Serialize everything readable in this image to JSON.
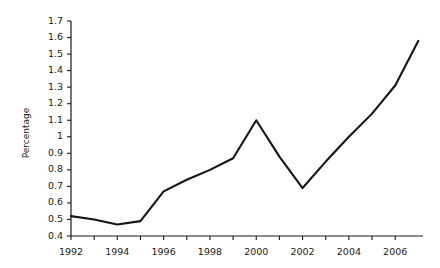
{
  "chart_data": {
    "type": "line",
    "title": "",
    "xlabel": "",
    "ylabel": "Percentage",
    "xlim": [
      1992,
      2007.2
    ],
    "ylim": [
      0.4,
      1.7
    ],
    "grid": false,
    "legend": false,
    "x": [
      1992,
      1993,
      1994,
      1995,
      1996,
      1997,
      1998,
      1999,
      2000,
      2001,
      2002,
      2003,
      2004,
      2005,
      2006,
      2007
    ],
    "values": [
      0.52,
      0.5,
      0.47,
      0.49,
      0.67,
      0.74,
      0.8,
      0.87,
      1.1,
      0.88,
      0.69,
      0.85,
      1.0,
      1.14,
      1.31,
      1.58
    ],
    "series": [
      {
        "name": "Percentage",
        "values": [
          0.52,
          0.5,
          0.47,
          0.49,
          0.67,
          0.74,
          0.8,
          0.87,
          1.1,
          0.88,
          0.69,
          0.85,
          1.0,
          1.14,
          1.31,
          1.58
        ]
      }
    ],
    "y_ticks": [
      0.4,
      0.5,
      0.6,
      0.7,
      0.8,
      0.9,
      1.0,
      1.1,
      1.2,
      1.3,
      1.4,
      1.5,
      1.6,
      1.7
    ],
    "y_tick_labels": [
      "0.4",
      "0.5",
      "0.6",
      "0.7",
      "0.8",
      "0.9",
      "1",
      "1.1",
      "1.2",
      "1.3",
      "1.4",
      "1.5",
      "1.6",
      "1.7"
    ],
    "x_ticks": [
      1992,
      1993,
      1994,
      1995,
      1996,
      1997,
      1998,
      1999,
      2000,
      2001,
      2002,
      2003,
      2004,
      2005,
      2006
    ],
    "x_tick_labels": [
      "1992",
      "",
      "1994",
      "",
      "1996",
      "",
      "1998",
      "",
      "2000",
      "",
      "2002",
      "",
      "2004",
      "",
      "2006"
    ],
    "line_color": "#151515",
    "axis_color": "#1a1a1a",
    "background_color": "#ffffff"
  }
}
